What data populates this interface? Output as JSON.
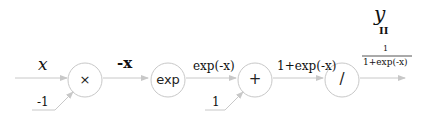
{
  "diagram": {
    "nodes": [
      {
        "id": "mul",
        "label": "×"
      },
      {
        "id": "exp",
        "label": "exp"
      },
      {
        "id": "add",
        "label": "+"
      },
      {
        "id": "div",
        "label": "/"
      }
    ],
    "edges": {
      "input_x": "x",
      "neg_x": "-x",
      "exp_out": "exp(-x)",
      "add_out": "1+exp(-x)",
      "const_mul": "-1",
      "const_add": "1"
    },
    "output": {
      "var": "y",
      "equals": "II",
      "numerator": "1",
      "denominator": "1+exp(-x)"
    }
  }
}
